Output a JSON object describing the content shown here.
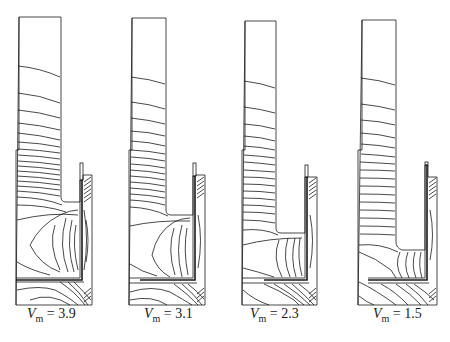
{
  "figure": {
    "type": "contour-plot-series",
    "stroke_color": "#1a1a1a",
    "background_color": "#ffffff",
    "panels": [
      {
        "id": "panel-1",
        "variable": "V",
        "subscript": "m",
        "equals": "=",
        "value": "3.9"
      },
      {
        "id": "panel-2",
        "variable": "V",
        "subscript": "m",
        "equals": "=",
        "value": "3.1"
      },
      {
        "id": "panel-3",
        "variable": "V",
        "subscript": "m",
        "equals": "=",
        "value": "2.3"
      },
      {
        "id": "panel-4",
        "variable": "V",
        "subscript": "m",
        "equals": "=",
        "value": "1.5"
      }
    ]
  }
}
